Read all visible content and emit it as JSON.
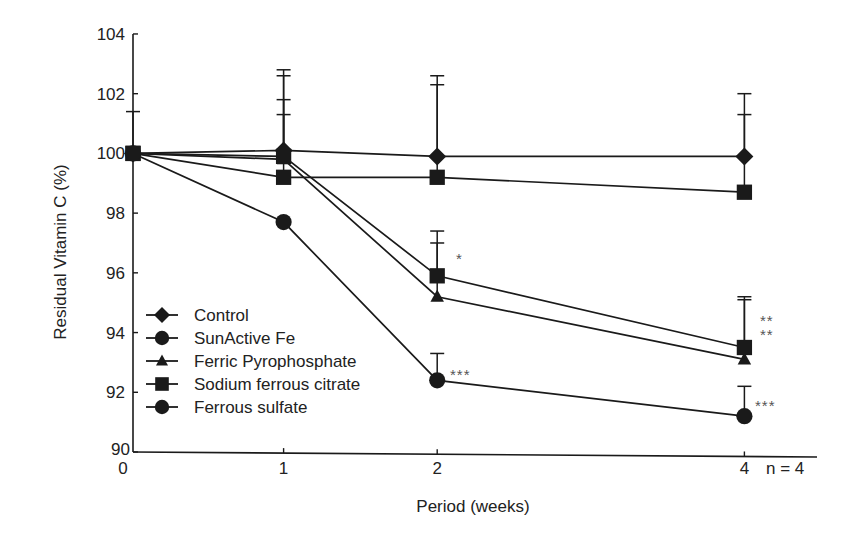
{
  "chart_data": {
    "type": "line",
    "title": "",
    "xlabel": "Period (weeks)",
    "ylabel": "Residual Vitamin C (%)",
    "x": [
      0,
      1,
      2,
      4
    ],
    "x_tick_labels": [
      "0",
      "1",
      "2",
      "4"
    ],
    "y_ticks": [
      90,
      92,
      94,
      96,
      98,
      100,
      102,
      104
    ],
    "ylim": [
      90,
      104
    ],
    "xlim": [
      0,
      4.5
    ],
    "grid": false,
    "legend_position": "lower-left inside",
    "series": [
      {
        "name": "Control",
        "marker": "diamond",
        "values": [
          100.0,
          100.1,
          99.9,
          99.9
        ],
        "error_upper": [
          null,
          102.8,
          102.6,
          102.0
        ]
      },
      {
        "name": "SunActive Fe",
        "marker": "square",
        "values": [
          100.0,
          99.2,
          99.2,
          98.7
        ],
        "error_upper": [
          null,
          101.3,
          102.3,
          101.3
        ]
      },
      {
        "name": "Ferric Pyrophosphate",
        "marker": "triangle",
        "values": [
          100.0,
          99.8,
          95.2,
          93.1
        ],
        "error_upper": [
          null,
          101.8,
          97.0,
          95.1
        ]
      },
      {
        "name": "Sodium ferrous citrate",
        "marker": "square",
        "values": [
          100.0,
          99.9,
          95.9,
          93.5
        ],
        "error_upper": [
          101.4,
          102.6,
          97.4,
          95.2
        ]
      },
      {
        "name": "Ferrous sulfate",
        "marker": "circle",
        "values": [
          100.0,
          97.7,
          92.4,
          91.2
        ],
        "error_upper": [
          null,
          null,
          93.3,
          92.2
        ]
      }
    ],
    "annotations": [
      {
        "x": 2,
        "y": 95.9,
        "text": "*"
      },
      {
        "x": 2,
        "y": 92.4,
        "text": "***"
      },
      {
        "x": 4,
        "y": 94.5,
        "text": "**"
      },
      {
        "x": 4,
        "y": 93.9,
        "text": "**"
      },
      {
        "x": 4,
        "y": 91.5,
        "text": "***"
      }
    ],
    "note": "n = 4"
  },
  "legend": {
    "items": [
      {
        "label": "Control",
        "marker": "diamond-icon"
      },
      {
        "label": "SunActive Fe",
        "marker": "circle-icon"
      },
      {
        "label": "Ferric Pyrophosphate",
        "marker": "triangle-icon"
      },
      {
        "label": "Sodium ferrous citrate",
        "marker": "square-icon"
      },
      {
        "label": "Ferrous sulfate",
        "marker": "circle-icon"
      }
    ]
  },
  "colors": {
    "line": "#1a1a1a",
    "marker": "#1a1a1a",
    "annotation": "#555555"
  }
}
